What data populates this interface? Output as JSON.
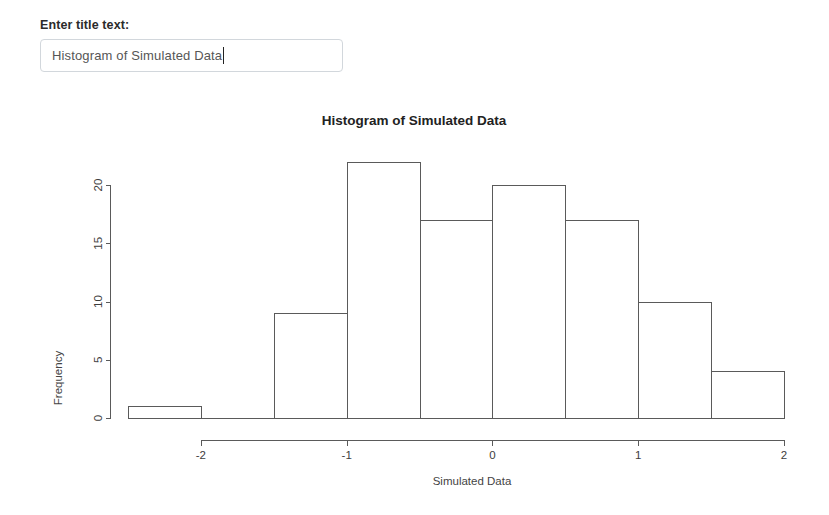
{
  "control_panel": {
    "title_input_label": "Enter title text:",
    "title_input_value": "Histogram of Simulated Data",
    "title_input_placeholder": "Enter title text:"
  },
  "chart_data": {
    "type": "bar",
    "subtype": "histogram",
    "title": "Histogram of Simulated Data",
    "xlabel": "Simulated Data",
    "ylabel": "Frequency",
    "grid": false,
    "legend": false,
    "xlim": [
      -2.5,
      2.0
    ],
    "ylim": [
      0,
      22
    ],
    "bin_width": 0.5,
    "x_ticks": [
      -2,
      -1,
      0,
      1,
      2
    ],
    "x_tick_labels": [
      "-2",
      "-1",
      "0",
      "1",
      "2"
    ],
    "y_ticks": [
      0,
      5,
      10,
      15,
      20
    ],
    "y_tick_labels": [
      "0",
      "5",
      "10",
      "15",
      "20"
    ],
    "bins": [
      {
        "label": "[-2.5,-2)",
        "x0": -2.5,
        "x1": -2.0,
        "value": 1
      },
      {
        "label": "[-2,-1.5)",
        "x0": -2.0,
        "x1": -1.5,
        "value": 0
      },
      {
        "label": "[-1.5,-1)",
        "x0": -1.5,
        "x1": -1.0,
        "value": 9
      },
      {
        "label": "[-1,-0.5)",
        "x0": -1.0,
        "x1": -0.5,
        "value": 22
      },
      {
        "label": "[-0.5,0)",
        "x0": -0.5,
        "x1": 0.0,
        "value": 17
      },
      {
        "label": "[0,0.5)",
        "x0": 0.0,
        "x1": 0.5,
        "value": 20
      },
      {
        "label": "[0.5,1)",
        "x0": 0.5,
        "x1": 1.0,
        "value": 17
      },
      {
        "label": "[1,1.5)",
        "x0": 1.0,
        "x1": 1.5,
        "value": 10
      },
      {
        "label": "[1.5,2]",
        "x0": 1.5,
        "x1": 2.0,
        "value": 4
      }
    ],
    "categories": [
      "[-2.5,-2)",
      "[-2,-1.5)",
      "[-1.5,-1)",
      "[-1,-0.5)",
      "[-0.5,0)",
      "[0,0.5)",
      "[0.5,1)",
      "[1,1.5)",
      "[1.5,2]"
    ],
    "values": [
      1,
      0,
      9,
      22,
      17,
      20,
      17,
      10,
      4
    ],
    "colors": {
      "bar_fill": "#ffffff",
      "bar_stroke": "#5a5a5a",
      "axis": "#5a5a5a",
      "text": "#333333",
      "background": "#ffffff",
      "input_border": "#d2d7dc"
    }
  }
}
